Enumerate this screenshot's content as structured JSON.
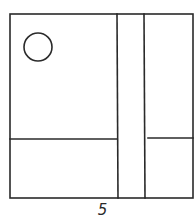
{
  "figure": {
    "label": "5",
    "stroke_color": "#2a2a2a",
    "background": "#ffffff"
  },
  "shapes": {
    "outer_frame": {
      "x1": 10,
      "y1": 14,
      "x2": 193,
      "y2": 198
    },
    "vertical_lines": [
      117,
      144
    ],
    "left_horizontal_y": 139,
    "right_horizontal": {
      "x1": 148,
      "x2": 193,
      "y": 138
    },
    "circle": {
      "cx": 38,
      "cy": 47,
      "r": 14
    }
  }
}
